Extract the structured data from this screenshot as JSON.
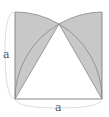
{
  "diagram": {
    "side_label_left": "a",
    "side_label_bottom": "a",
    "colors": {
      "fill": "#c8c8c8",
      "stroke": "#777777",
      "brace": "#cccccc"
    }
  }
}
